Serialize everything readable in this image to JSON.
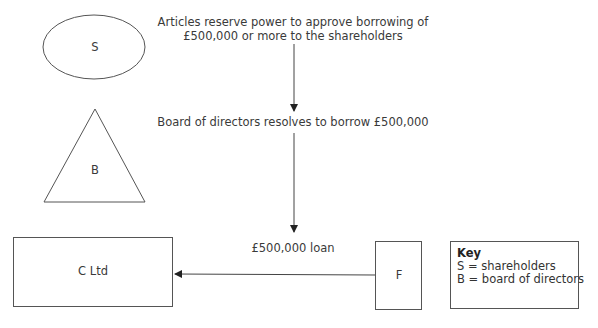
{
  "shapes": {
    "shareholders": {
      "label": "S",
      "shape": "ellipse"
    },
    "board": {
      "label": "B",
      "shape": "triangle"
    },
    "company": {
      "label": "C Ltd",
      "shape": "rectangle"
    },
    "financier": {
      "label": "F",
      "shape": "rectangle"
    }
  },
  "annotations": {
    "articles_line1": "Articles reserve power to approve borrowing of",
    "articles_line2": "£500,000 or more to the shareholders",
    "board_resolution": "Board of directors resolves to borrow £500,000",
    "loan": "£500,000 loan"
  },
  "key": {
    "title": "Key",
    "items": [
      "S = shareholders",
      "B = board of directors"
    ]
  },
  "colors": {
    "stroke": "#555555",
    "text": "#333333",
    "background": "#ffffff"
  }
}
